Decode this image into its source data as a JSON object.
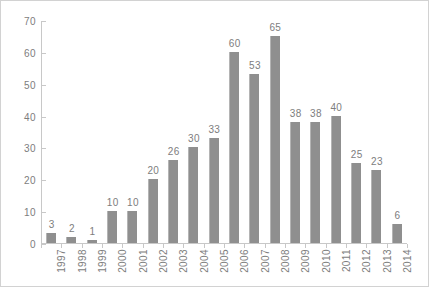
{
  "chart_data": {
    "type": "bar",
    "title": "",
    "subtitle": "",
    "xlabel": "",
    "ylabel": "",
    "categories": [
      "1997",
      "1998",
      "1999",
      "2000",
      "2001",
      "2002",
      "2003",
      "2004",
      "2005",
      "2006",
      "2007",
      "2008",
      "2009",
      "2010",
      "2011",
      "2012",
      "2013",
      "2014"
    ],
    "values": [
      3,
      2,
      1,
      10,
      10,
      20,
      26,
      30,
      33,
      60,
      53,
      65,
      38,
      38,
      40,
      25,
      23,
      6
    ],
    "data_labels": [
      "3",
      "2",
      "1",
      "10",
      "10",
      "20",
      "26",
      "30",
      "33",
      "60",
      "53",
      "65",
      "38",
      "38",
      "40",
      "25",
      "23",
      "6"
    ],
    "ylim": [
      0,
      70
    ],
    "ytick_values": [
      0,
      10,
      20,
      30,
      40,
      50,
      60,
      70
    ],
    "ytick_labels": [
      "0",
      "10",
      "20",
      "30",
      "40",
      "50",
      "60",
      "70"
    ],
    "grid": false,
    "legend": null,
    "legend_position": "none",
    "series": [
      {
        "name": "",
        "values": [
          3,
          2,
          1,
          10,
          10,
          20,
          26,
          30,
          33,
          60,
          53,
          65,
          38,
          38,
          40,
          25,
          23,
          6
        ],
        "color": "#8f8f8f"
      }
    ],
    "annotations": []
  },
  "style": {
    "bar_color": "#8f8f8f",
    "bar_edge_color": "#b4b4b4",
    "axis_color": "#c8c8c8",
    "label_color": "#7d7d7d",
    "border_color": "#d2d2d2",
    "background": "#ffffff"
  }
}
